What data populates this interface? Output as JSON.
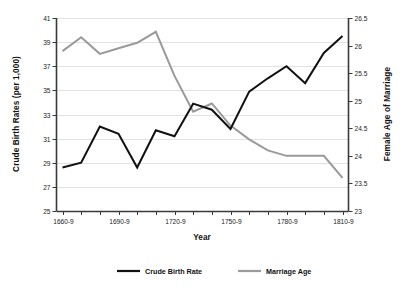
{
  "chart_data": {
    "type": "line",
    "title": "",
    "xlabel": "Year",
    "ylabel": "Crude Birth Rates (per 1,000)",
    "y2label": "Female Age of Marriage",
    "grid": true,
    "legend_position": "bottom",
    "x": [
      "1660-9",
      "1670-9",
      "1680-9",
      "1690-9",
      "1700-9",
      "1710-9",
      "1720-9",
      "1730-9",
      "1740-9",
      "1750-9",
      "1760-9",
      "1770-9",
      "1780-9",
      "1790-9",
      "1800-9",
      "1810-9"
    ],
    "xtick_labels": [
      "1660-9",
      "1690-9",
      "1720-9",
      "1750-9",
      "1780-9",
      "1810-9"
    ],
    "ylim": [
      25,
      41
    ],
    "yticks": [
      25,
      27,
      29,
      31,
      33,
      35,
      37,
      39,
      41
    ],
    "ytick_labels": [
      "25",
      "27",
      "29",
      "31",
      "33",
      "35",
      "37",
      "39",
      "41"
    ],
    "y2lim": [
      23,
      26.5
    ],
    "y2ticks": [
      23,
      23.5,
      24,
      24.5,
      25,
      25.5,
      26,
      26.5
    ],
    "y2tick_labels": [
      "23",
      "23.5",
      "24",
      "24.5",
      "25",
      "25.5",
      "26",
      "26.5"
    ],
    "series": [
      {
        "name": "Crude Birth Rate",
        "axis": "left",
        "color": "#111111",
        "values": [
          28.6,
          29.0,
          32.0,
          31.4,
          28.6,
          31.7,
          31.2,
          33.9,
          33.4,
          31.8,
          34.9,
          36.0,
          37.0,
          35.6,
          38.1,
          39.5
        ]
      },
      {
        "name": "Marriage Age",
        "axis": "right",
        "color": "#9a9a9a",
        "values": [
          25.9,
          26.15,
          25.85,
          25.95,
          26.05,
          26.25,
          25.45,
          24.8,
          24.95,
          24.55,
          24.3,
          24.1,
          24.0,
          24.0,
          24.0,
          23.6
        ]
      }
    ],
    "legend": [
      {
        "label": "Crude Birth Rate",
        "color": "#111111"
      },
      {
        "label": "Marriage Age",
        "color": "#9a9a9a"
      }
    ]
  }
}
